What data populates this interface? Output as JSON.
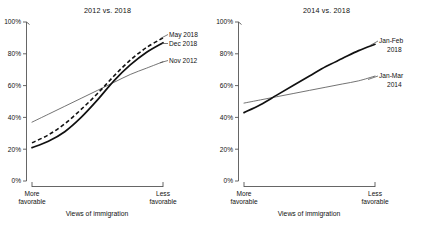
{
  "figure": {
    "xlabel": "Views of immigration",
    "x_left_cap_line1": "More",
    "x_left_cap_line2": "favorable",
    "x_right_cap_line1": "Less",
    "x_right_cap_line2": "favorable",
    "ytick_labels": [
      "0%",
      "20%",
      "40%",
      "60%",
      "80%",
      "100%"
    ]
  },
  "chart_data": [
    {
      "type": "line",
      "title": "2012 vs. 2018",
      "xlabel": "Views of immigration",
      "ylabel": "",
      "xlim": [
        0,
        1
      ],
      "ylim": [
        0,
        100
      ],
      "grid": false,
      "legend_position": "inline-right-of-curve-ends",
      "xticks": [
        0,
        1
      ],
      "xticklabels": [
        "More favorable",
        "Less favorable"
      ],
      "yticks": [
        0,
        20,
        40,
        60,
        80,
        100
      ],
      "yticklabels": [
        "0%",
        "20%",
        "40%",
        "60%",
        "80%",
        "100%"
      ],
      "x": [
        0,
        0.125,
        0.25,
        0.375,
        0.5,
        0.625,
        0.75,
        0.875,
        1
      ],
      "series": [
        {
          "name": "May 2018",
          "label_line1": "May 2018",
          "label_line2": "",
          "style": "dashed",
          "color": "#111111",
          "values": [
            24,
            29,
            36,
            45,
            55,
            66,
            76,
            84,
            90
          ]
        },
        {
          "name": "Dec 2018",
          "label_line1": "Dec 2018",
          "label_line2": "",
          "style": "solid-thick",
          "color": "#111111",
          "values": [
            21,
            25,
            31,
            40,
            51,
            63,
            73,
            81,
            87
          ]
        },
        {
          "name": "Nov 2012",
          "label_line1": "Nov 2012",
          "label_line2": "",
          "style": "solid-thin",
          "color": "#5a5a5a",
          "values": [
            37,
            42,
            47,
            52,
            57,
            62,
            67,
            71,
            75
          ]
        }
      ]
    },
    {
      "type": "line",
      "title": "2014 vs. 2018",
      "xlabel": "Views of immigration",
      "ylabel": "",
      "xlim": [
        0,
        1
      ],
      "ylim": [
        0,
        100
      ],
      "grid": false,
      "legend_position": "inline-right-of-curve-ends",
      "xticks": [
        0,
        1
      ],
      "xticklabels": [
        "More favorable",
        "Less favorable"
      ],
      "yticks": [
        0,
        20,
        40,
        60,
        80,
        100
      ],
      "yticklabels": [
        "0%",
        "20%",
        "40%",
        "60%",
        "80%",
        "100%"
      ],
      "x": [
        0,
        0.125,
        0.25,
        0.375,
        0.5,
        0.625,
        0.75,
        0.875,
        1
      ],
      "series": [
        {
          "name": "Jan-Feb 2018",
          "label_line1": "Jan-Feb",
          "label_line2": "2018",
          "style": "solid-thick",
          "color": "#111111",
          "values": [
            43,
            48,
            54,
            60,
            66,
            72,
            77,
            82,
            86
          ]
        },
        {
          "name": "Jan-Mar 2014",
          "label_line1": "Jan-Mar",
          "label_line2": "2014",
          "style": "solid-thin",
          "color": "#5a5a5a",
          "values": [
            49,
            51,
            53,
            55,
            57,
            59,
            61,
            63,
            66
          ]
        }
      ]
    }
  ]
}
